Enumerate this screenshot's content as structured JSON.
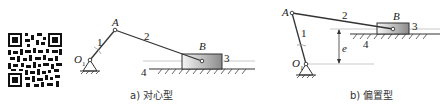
{
  "figure": {
    "qr_code": {
      "semantic": "qr-code"
    },
    "diagrams": [
      {
        "id": "a",
        "caption": "a) 对心型",
        "labels": {
          "pivot": "O",
          "pivot_sub": "1",
          "joint_a": "A",
          "joint_b": "B",
          "crank": "1",
          "connecting_rod": "2",
          "slider": "3",
          "frame": "4"
        }
      },
      {
        "id": "b",
        "caption": "b) 偏置型",
        "labels": {
          "pivot": "O",
          "pivot_sub": "1",
          "joint_a": "A",
          "joint_b": "B",
          "crank": "1",
          "connecting_rod": "2",
          "slider": "3",
          "frame": "4",
          "offset": "e"
        }
      }
    ],
    "colors": {
      "line": "#333333",
      "guide": "#bbbbbb",
      "slider_light": "#f4f4f4",
      "slider_dark": "#8a8a8a"
    }
  }
}
